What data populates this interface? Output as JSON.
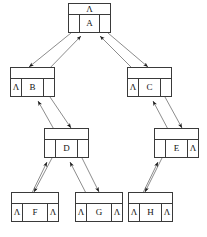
{
  "diagram": {
    "null_symbol": "Λ",
    "nodes": [
      {
        "id": "A",
        "label": "A",
        "x": 68,
        "y": 3,
        "w": 43,
        "h": 30,
        "top": "Λ",
        "left": "",
        "right": "",
        "left_null": false,
        "right_null": false,
        "show_top": true
      },
      {
        "id": "B",
        "label": "B",
        "x": 10,
        "y": 67,
        "w": 45,
        "h": 30,
        "top": "",
        "left": "Λ",
        "right": "",
        "left_null": true,
        "right_null": false,
        "show_top": true
      },
      {
        "id": "C",
        "label": "C",
        "x": 127,
        "y": 67,
        "w": 45,
        "h": 30,
        "top": "",
        "left": "Λ",
        "right": "",
        "left_null": true,
        "right_null": false,
        "show_top": true
      },
      {
        "id": "D",
        "label": "D",
        "x": 44,
        "y": 128,
        "w": 45,
        "h": 30,
        "top": "",
        "left": "",
        "right": "",
        "left_null": false,
        "right_null": false,
        "show_top": true
      },
      {
        "id": "E",
        "label": "E",
        "x": 154,
        "y": 128,
        "w": 45,
        "h": 30,
        "top": "",
        "left": "",
        "right": "Λ",
        "left_null": false,
        "right_null": true,
        "show_top": true
      },
      {
        "id": "F",
        "label": "F",
        "x": 11,
        "y": 192,
        "w": 48,
        "h": 30,
        "top": "",
        "left": "Λ",
        "right": "Λ",
        "left_null": true,
        "right_null": true,
        "show_top": true
      },
      {
        "id": "G",
        "label": "G",
        "x": 75,
        "y": 192,
        "w": 48,
        "h": 30,
        "top": "",
        "left": "Λ",
        "right": "Λ",
        "left_null": true,
        "right_null": true,
        "show_top": true
      },
      {
        "id": "H",
        "label": "H",
        "x": 128,
        "y": 192,
        "w": 45,
        "h": 30,
        "top": "",
        "left": "Λ",
        "right": "Λ",
        "left_null": true,
        "right_null": true,
        "show_top": true
      }
    ],
    "edges": [
      {
        "from": "A",
        "to": "B",
        "kind": "bidirectional"
      },
      {
        "from": "A",
        "to": "C",
        "kind": "bidirectional"
      },
      {
        "from": "B",
        "to": "D",
        "kind": "bidirectional"
      },
      {
        "from": "C",
        "to": "E",
        "kind": "bidirectional"
      },
      {
        "from": "D",
        "to": "F",
        "kind": "bidirectional"
      },
      {
        "from": "D",
        "to": "G",
        "kind": "bidirectional"
      },
      {
        "from": "E",
        "to": "H",
        "kind": "bidirectional"
      }
    ],
    "colors": {
      "stroke": "#3a3a3a",
      "arrow": "#1a1a1a",
      "text": "#111111",
      "background": "#ffffff"
    }
  }
}
